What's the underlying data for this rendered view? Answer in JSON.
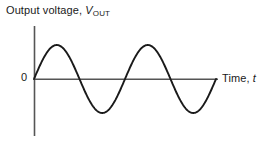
{
  "figure": {
    "background_color": "#ffffff",
    "axis_color": "#555555",
    "curve_color": "#1a1a1a",
    "text_color": "#1a1a1a"
  },
  "labels": {
    "y_axis_main": "Output voltage,",
    "y_axis_symbol": "V",
    "y_axis_subscript": "OUT",
    "origin": "0",
    "x_axis_main": "Time,",
    "x_axis_symbol": "t"
  },
  "chart_data": {
    "type": "line",
    "title": "",
    "xlabel": "Time, t",
    "ylabel": "Output voltage, VOUT",
    "legend": [],
    "grid": false,
    "xlim": [
      0,
      2.0
    ],
    "ylim": [
      -1.2,
      1.2
    ],
    "xticks": [],
    "yticks": [
      0
    ],
    "ytick_labels": [
      "0"
    ],
    "annotations": [],
    "series": [
      {
        "name": "Output voltage",
        "waveform": "sine",
        "amplitude": 1.0,
        "cycles": 2,
        "phase_deg": 0,
        "offset": 0,
        "x": [
          0,
          0.0625,
          0.125,
          0.1875,
          0.25,
          0.3125,
          0.375,
          0.4375,
          0.5,
          0.5625,
          0.625,
          0.6875,
          0.75,
          0.8125,
          0.875,
          0.9375,
          1.0,
          1.0625,
          1.125,
          1.1875,
          1.25,
          1.3125,
          1.375,
          1.4375,
          1.5,
          1.5625,
          1.625,
          1.6875,
          1.75,
          1.8125,
          1.875,
          1.9375,
          2.0
        ],
        "values": [
          0,
          0.383,
          0.707,
          0.924,
          1.0,
          0.924,
          0.707,
          0.383,
          0,
          -0.383,
          -0.707,
          -0.924,
          -1.0,
          -0.924,
          -0.707,
          -0.383,
          0,
          0.383,
          0.707,
          0.924,
          1.0,
          0.924,
          0.707,
          0.383,
          0,
          -0.383,
          -0.707,
          -0.924,
          -1.0,
          -0.924,
          -0.707,
          -0.383,
          0
        ]
      }
    ]
  },
  "geometry": {
    "origin_x": 34,
    "origin_y": 79,
    "amplitude_px": 34,
    "period_px": 91,
    "x_axis_end": 218,
    "y_axis_top": 26,
    "y_axis_bottom": 136,
    "curve_end_x": 216
  }
}
